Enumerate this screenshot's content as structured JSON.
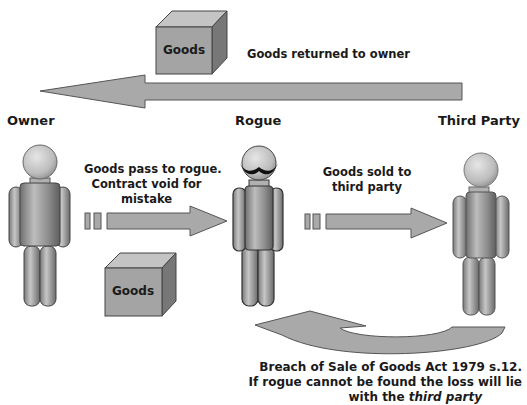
{
  "actors": {
    "owner": "Owner",
    "rogue": "Rogue",
    "third_party": "Third Party"
  },
  "boxes": {
    "top_goods": "Goods",
    "bottom_goods": "Goods"
  },
  "arrows": {
    "return_label": "Goods returned to owner",
    "owner_to_rogue_label_1": "Goods pass to rogue.",
    "owner_to_rogue_label_2": "Contract void for",
    "owner_to_rogue_label_3": "mistake",
    "rogue_to_third_label_1": "Goods sold to",
    "rogue_to_third_label_2": "third party"
  },
  "footer": {
    "line1": "Breach of Sale of Goods Act 1979 s.12.",
    "line2": "If rogue cannot be found the loss will lie",
    "line3_prefix": "with the ",
    "line3_emph": "third party"
  },
  "colors": {
    "arrow_fill": "#a9a9a9",
    "arrow_stroke": "#555555",
    "box_front": "#a4a4a4",
    "box_top": "#c4c4c4",
    "box_side": "#777777",
    "figure_gray": "#9a9a9a",
    "mustache": "#111111"
  }
}
